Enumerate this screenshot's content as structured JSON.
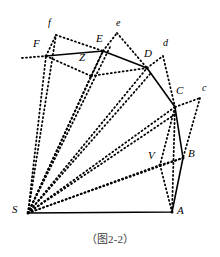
{
  "figure": {
    "caption": "（图2-2）",
    "colors": {
      "stroke": "#000000",
      "background": "#ffffff",
      "caption_text": "#3a3a3a"
    },
    "style": {
      "solid_width": 1.6,
      "dotted_width": 1.8,
      "dotted_dash": "1,3"
    },
    "points": {
      "S": {
        "x": 28,
        "y": 213
      },
      "A": {
        "x": 172,
        "y": 212
      },
      "B": {
        "x": 183,
        "y": 158
      },
      "C": {
        "x": 175,
        "y": 107
      },
      "D": {
        "x": 147,
        "y": 68
      },
      "E": {
        "x": 103,
        "y": 51
      },
      "F": {
        "x": 46,
        "y": 56
      },
      "V": {
        "x": 160,
        "y": 165
      },
      "Z": {
        "x": 91,
        "y": 76
      },
      "c_small": {
        "x": 200,
        "y": 98
      },
      "d_small": {
        "x": 163,
        "y": 56
      },
      "e_small": {
        "x": 117,
        "y": 33
      },
      "f_small": {
        "x": 56,
        "y": 35
      },
      "F_left_tail": {
        "x": 22,
        "y": 58
      },
      "S_fan_1": {
        "x": 46,
        "y": 56
      },
      "S_fan_2": {
        "x": 56,
        "y": 35
      },
      "c_tail_low": {
        "x": 196,
        "y": 112
      }
    },
    "solid_path": "M 28 213 L 172 212 L 183 158 L 175 107 L 147 68 L 103 51 L 46 56",
    "dotted_segments": [
      {
        "name": "S-to-F",
        "d": "M 28 213 L 46 56"
      },
      {
        "name": "S-to-f",
        "d": "M 28 213 L 56 35"
      },
      {
        "name": "S-to-Z",
        "d": "M 28 213 L 91 76"
      },
      {
        "name": "S-to-E",
        "d": "M 28 213 L 103 51"
      },
      {
        "name": "S-to-e-arm",
        "d": "M 28 213 L 110 47"
      },
      {
        "name": "S-to-D",
        "d": "M 28 213 L 147 68"
      },
      {
        "name": "S-to-Dlow",
        "d": "M 28 213 L 151 73"
      },
      {
        "name": "S-to-C",
        "d": "M 28 213 L 175 107"
      },
      {
        "name": "S-to-Clow",
        "d": "M 28 213 L 177 113"
      },
      {
        "name": "S-to-V-B",
        "d": "M 28 213 L 183 158"
      },
      {
        "name": "F-left-tail",
        "d": "M 22 58 L 46 56"
      },
      {
        "name": "f-to-E",
        "d": "M 56 35 L 103 51"
      },
      {
        "name": "F-to-f",
        "d": "M 46 56 L 56 35"
      },
      {
        "name": "F-to-Z",
        "d": "M 46 56 L 91 76"
      },
      {
        "name": "Z-to-E",
        "d": "M 91 76 L 103 51"
      },
      {
        "name": "Z-to-D",
        "d": "M 91 76 L 147 68"
      },
      {
        "name": "E-to-e",
        "d": "M 103 51 L 117 33"
      },
      {
        "name": "e-to-D",
        "d": "M 117 33 L 147 68"
      },
      {
        "name": "D-to-d",
        "d": "M 147 68 L 163 56"
      },
      {
        "name": "d-to-C",
        "d": "M 163 56 L 175 107"
      },
      {
        "name": "C-to-c",
        "d": "M 175 107 L 200 98"
      },
      {
        "name": "c-to-B",
        "d": "M 200 98 L 183 158"
      },
      {
        "name": "C-to-A",
        "d": "M 175 107 L 172 212"
      },
      {
        "name": "C-to-V",
        "d": "M 175 107 L 160 165"
      },
      {
        "name": "V-to-A",
        "d": "M 160 165 L 172 212"
      },
      {
        "name": "V-to-B",
        "d": "M 160 165 L 183 158"
      },
      {
        "name": "S-to-A-fan",
        "d": "M 28 213 L 160 165"
      }
    ],
    "labels": [
      {
        "name": "label-S",
        "text": "S",
        "x": 12,
        "y": 204,
        "size": "normal"
      },
      {
        "name": "label-A",
        "text": "A",
        "x": 177,
        "y": 205,
        "size": "normal"
      },
      {
        "name": "label-B",
        "text": "B",
        "x": 188,
        "y": 148,
        "size": "normal"
      },
      {
        "name": "label-C",
        "text": "C",
        "x": 176,
        "y": 85,
        "size": "normal"
      },
      {
        "name": "label-D",
        "text": "D",
        "x": 144,
        "y": 48,
        "size": "normal"
      },
      {
        "name": "label-E",
        "text": "E",
        "x": 96,
        "y": 33,
        "size": "normal"
      },
      {
        "name": "label-F",
        "text": "F",
        "x": 33,
        "y": 38,
        "size": "normal"
      },
      {
        "name": "label-V",
        "text": "V",
        "x": 148,
        "y": 150,
        "size": "normal"
      },
      {
        "name": "label-Z",
        "text": "Z",
        "x": 79,
        "y": 52,
        "size": "normal"
      },
      {
        "name": "label-c",
        "text": "c",
        "x": 202,
        "y": 83,
        "size": "small"
      },
      {
        "name": "label-d",
        "text": "d",
        "x": 163,
        "y": 38,
        "size": "small"
      },
      {
        "name": "label-e",
        "text": "e",
        "x": 116,
        "y": 18,
        "size": "small"
      },
      {
        "name": "label-f",
        "text": "f",
        "x": 48,
        "y": 18,
        "size": "small"
      }
    ]
  }
}
